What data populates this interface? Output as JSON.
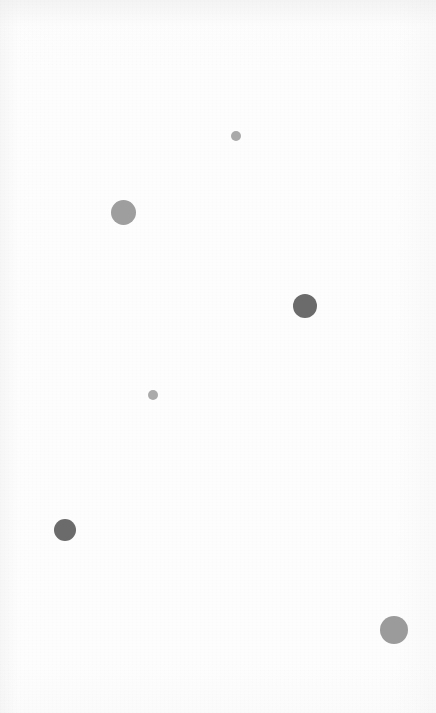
{
  "canvas": {
    "width": 436,
    "height": 713,
    "background_color": "#fdfdfd",
    "texture": "paper-grain"
  },
  "chart_data": {
    "type": "scatter",
    "title": "",
    "subtitle": "",
    "xlabel": "",
    "ylabel": "",
    "xlim": [
      0,
      436
    ],
    "ylim": [
      713,
      0
    ],
    "grid": false,
    "axes_visible": false,
    "tick_labels_visible": false,
    "legend": null,
    "legend_position": "none",
    "annotations": [],
    "marker_shape": "circle",
    "size_encoding": "radius_px",
    "color_encoding": "grayscale",
    "points": [
      {
        "id": "dot-1",
        "x": 236,
        "y": 136,
        "radius": 5,
        "diameter": 10,
        "color": "#a9a9a9",
        "shade": "light-gray",
        "label": ""
      },
      {
        "id": "dot-2",
        "x": 123,
        "y": 212,
        "radius": 12.5,
        "diameter": 25,
        "color": "#9e9e9e",
        "shade": "medium-gray",
        "label": ""
      },
      {
        "id": "dot-3",
        "x": 305,
        "y": 306,
        "radius": 12,
        "diameter": 24,
        "color": "#6b6b6b",
        "shade": "dark-gray",
        "label": ""
      },
      {
        "id": "dot-4",
        "x": 153,
        "y": 395,
        "radius": 5,
        "diameter": 10,
        "color": "#aaaaaa",
        "shade": "light-gray",
        "label": ""
      },
      {
        "id": "dot-5",
        "x": 65,
        "y": 530,
        "radius": 11,
        "diameter": 22,
        "color": "#6b6b6b",
        "shade": "dark-gray",
        "label": ""
      },
      {
        "id": "dot-6",
        "x": 394,
        "y": 630,
        "radius": 14,
        "diameter": 28,
        "color": "#9b9b9b",
        "shade": "medium-gray",
        "label": ""
      }
    ]
  }
}
